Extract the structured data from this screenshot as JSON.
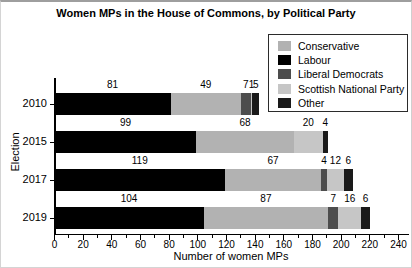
{
  "title": "Women MPs in the House of Commons, by Political Party",
  "chart_data": {
    "type": "bar",
    "orientation": "horizontal-stacked",
    "title": "Women MPs in the House of Commons, by Political Party",
    "categories": [
      "2010",
      "2015",
      "2017",
      "2019"
    ],
    "series": [
      {
        "name": "Conservative",
        "color": "#b2b2b2",
        "values": [
          49,
          68,
          67,
          87
        ]
      },
      {
        "name": "Labour",
        "color": "#000000",
        "values": [
          81,
          99,
          119,
          104
        ]
      },
      {
        "name": "Liberal Democrats",
        "color": "#4d4d4d",
        "values": [
          7,
          0,
          4,
          7
        ]
      },
      {
        "name": "Scottish National Party",
        "color": "#c6c6c6",
        "values": [
          1,
          20,
          12,
          16
        ]
      },
      {
        "name": "Other",
        "color": "#1a1a1a",
        "values": [
          5,
          4,
          6,
          6
        ]
      }
    ],
    "stack_order": [
      "Labour",
      "Conservative",
      "Liberal Democrats",
      "Scottish National Party",
      "Other"
    ],
    "bar_totals": [
      143,
      191,
      208,
      220
    ],
    "xlabel": "Number of women MPs",
    "ylabel": "Election",
    "xlim": [
      0,
      245
    ],
    "xticks_major": [
      0,
      20,
      40,
      60,
      80,
      100,
      120,
      140,
      160,
      180,
      200,
      220,
      240
    ],
    "xticks_minor": [
      10,
      30,
      50,
      70,
      90,
      110,
      130,
      150,
      170,
      190,
      210,
      230
    ],
    "grid": false,
    "value_labels": true,
    "legend_position": "upper-right"
  },
  "legend": {
    "items": [
      {
        "label": "Conservative",
        "color": "#b2b2b2"
      },
      {
        "label": "Labour",
        "color": "#000000"
      },
      {
        "label": "Liberal Democrats",
        "color": "#4d4d4d"
      },
      {
        "label": "Scottish National Party",
        "color": "#c6c6c6"
      },
      {
        "label": "Other",
        "color": "#1a1a1a"
      }
    ]
  }
}
